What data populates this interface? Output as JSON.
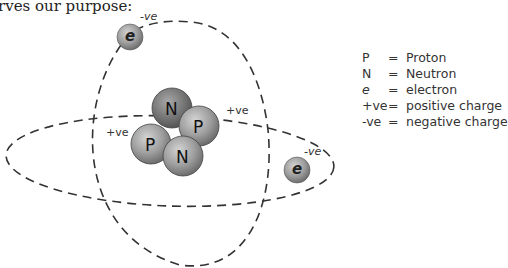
{
  "intro_text": "rves our purpose:",
  "nucleus": {
    "particles": [
      {
        "label": "N",
        "type": "neutron"
      },
      {
        "label": "P",
        "type": "proton"
      },
      {
        "label": "P",
        "type": "proton"
      },
      {
        "label": "N",
        "type": "neutron"
      }
    ],
    "charge_labels": [
      "+ve",
      "+ve"
    ]
  },
  "electrons": [
    {
      "label": "e",
      "charge": "-ve"
    },
    {
      "label": "e",
      "charge": "-ve"
    }
  ],
  "legend": [
    {
      "symbol": "P",
      "eq": "=",
      "description": "Proton"
    },
    {
      "symbol": "N",
      "eq": "=",
      "description": "Neutron"
    },
    {
      "symbol": "e",
      "eq": "=",
      "description": "electron"
    },
    {
      "symbol": "+ve",
      "eq": "=",
      "description": "positive charge"
    },
    {
      "symbol": "-ve",
      "eq": "=",
      "description": "negative charge"
    }
  ],
  "colors": {
    "orbit": "#333333",
    "sphere_light": "#c8c8c8",
    "sphere_dark": "#7a7a7a",
    "text": "#333333"
  }
}
